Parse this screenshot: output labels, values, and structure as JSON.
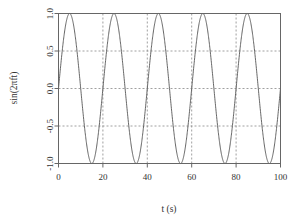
{
  "chart_data": {
    "type": "line",
    "title": "",
    "subtitle": "",
    "xlabel": "t (s)",
    "ylabel": "sin(2πft)",
    "xlim": [
      0,
      100
    ],
    "ylim": [
      -1.0,
      1.0
    ],
    "xticks": [
      0,
      20,
      40,
      60,
      80,
      100
    ],
    "xtick_labels": [
      "0",
      "20",
      "40",
      "60",
      "80",
      "100"
    ],
    "yticks": [
      1.0,
      0.5,
      0.0,
      -0.5,
      -1.0
    ],
    "ytick_labels": [
      "1.0",
      "0.5",
      "0.0",
      "-0.5",
      "-1.0"
    ],
    "grid": true,
    "grid_style": "dashed",
    "grid_color": "#888888",
    "legend": null,
    "legend_position": "none",
    "line_color": "#555555",
    "frame_color": "#666666",
    "series": [
      {
        "name": "sin(2πft)",
        "frequency_hz": 0.05,
        "period_s": 20,
        "amplitude": 1.0,
        "phase": 0,
        "n_cycles": 5,
        "x": [
          0,
          1,
          2,
          3,
          4,
          5,
          6,
          7,
          8,
          9,
          10,
          11,
          12,
          13,
          14,
          15,
          16,
          17,
          18,
          19,
          20,
          21,
          22,
          23,
          24,
          25,
          26,
          27,
          28,
          29,
          30,
          31,
          32,
          33,
          34,
          35,
          36,
          37,
          38,
          39,
          40,
          41,
          42,
          43,
          44,
          45,
          46,
          47,
          48,
          49,
          50,
          51,
          52,
          53,
          54,
          55,
          56,
          57,
          58,
          59,
          60,
          61,
          62,
          63,
          64,
          65,
          66,
          67,
          68,
          69,
          70,
          71,
          72,
          73,
          74,
          75,
          76,
          77,
          78,
          79,
          80,
          81,
          82,
          83,
          84,
          85,
          86,
          87,
          88,
          89,
          90,
          91,
          92,
          93,
          94,
          95,
          96,
          97,
          98,
          99,
          100
        ],
        "values": [
          0.0,
          0.309,
          0.588,
          0.809,
          0.951,
          1.0,
          0.951,
          0.809,
          0.588,
          0.309,
          0.0,
          -0.309,
          -0.588,
          -0.809,
          -0.951,
          -1.0,
          -0.951,
          -0.809,
          -0.588,
          -0.309,
          0.0,
          0.309,
          0.588,
          0.809,
          0.951,
          1.0,
          0.951,
          0.809,
          0.588,
          0.309,
          0.0,
          -0.309,
          -0.588,
          -0.809,
          -0.951,
          -1.0,
          -0.951,
          -0.809,
          -0.588,
          -0.309,
          0.0,
          0.309,
          0.588,
          0.809,
          0.951,
          1.0,
          0.951,
          0.809,
          0.588,
          0.309,
          0.0,
          -0.309,
          -0.588,
          -0.809,
          -0.951,
          -1.0,
          -0.951,
          -0.809,
          -0.588,
          -0.309,
          0.0,
          0.309,
          0.588,
          0.809,
          0.951,
          1.0,
          0.951,
          0.809,
          0.588,
          0.309,
          0.0,
          -0.309,
          -0.588,
          -0.809,
          -0.951,
          -1.0,
          -0.951,
          -0.809,
          -0.588,
          -0.309,
          0.0,
          0.309,
          0.588,
          0.809,
          0.951,
          1.0,
          0.951,
          0.809,
          0.588,
          0.309,
          0.0,
          -0.309,
          -0.588,
          -0.809,
          -0.951,
          -1.0,
          -0.951,
          -0.809,
          -0.588,
          -0.309,
          0.0
        ],
        "peaks_at": [
          5,
          25,
          45,
          65,
          85
        ],
        "troughs_at": [
          15,
          35,
          55,
          75,
          95
        ]
      }
    ]
  }
}
